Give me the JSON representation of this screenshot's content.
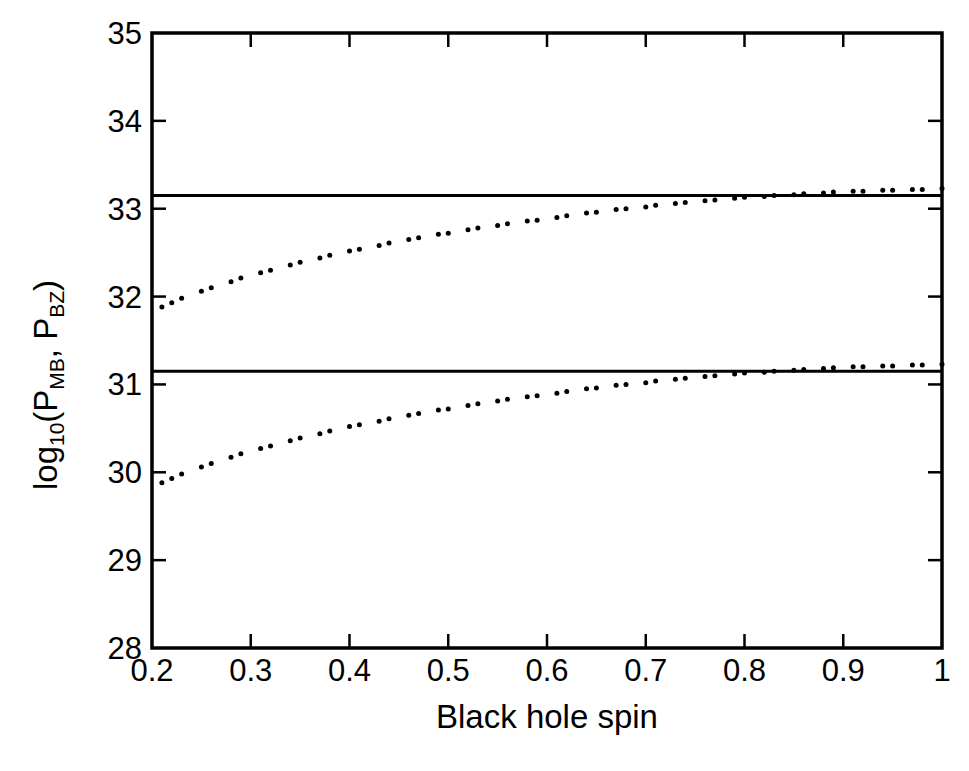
{
  "figure": {
    "background": "#ffffff",
    "ink": "#000000",
    "width": 969,
    "height": 771
  },
  "chart_data": {
    "type": "scatter",
    "title": "",
    "subtitle": "",
    "xlabel": "Black hole spin",
    "ylabel": "log10(PMB, PBZ)",
    "ylabel_parts": {
      "prefix": "log",
      "prefix_sub": "10",
      "open": "(P",
      "sub1": "MB",
      "mid": ", P",
      "sub2": "BZ",
      "close": ")"
    },
    "xlim": [
      0.2,
      1.0
    ],
    "ylim": [
      28,
      35
    ],
    "xticks": [
      0.2,
      0.3,
      0.4,
      0.5,
      0.6,
      0.7,
      0.8,
      0.9,
      1.0
    ],
    "xticklabels": [
      "0.2",
      "0.3",
      "0.4",
      "0.5",
      "0.6",
      "0.7",
      "0.8",
      "0.9",
      "1"
    ],
    "yticks": [
      28,
      29,
      30,
      31,
      32,
      33,
      34,
      35
    ],
    "yticklabels": [
      "28",
      "29",
      "30",
      "31",
      "32",
      "33",
      "34",
      "35"
    ],
    "grid": false,
    "legend": null,
    "frame": "box",
    "tick_direction": "in",
    "series": [
      {
        "name": "P_BZ",
        "style": "dotted",
        "marker": "dot",
        "marker_size_px": 5,
        "color": "#000000",
        "x": [
          0.21,
          0.22,
          0.23,
          0.25,
          0.26,
          0.28,
          0.29,
          0.31,
          0.32,
          0.34,
          0.35,
          0.37,
          0.38,
          0.4,
          0.41,
          0.43,
          0.44,
          0.46,
          0.47,
          0.49,
          0.5,
          0.52,
          0.53,
          0.55,
          0.56,
          0.58,
          0.59,
          0.61,
          0.62,
          0.64,
          0.65,
          0.67,
          0.68,
          0.7,
          0.71,
          0.73,
          0.74,
          0.76,
          0.77,
          0.79,
          0.8,
          0.82,
          0.83,
          0.85,
          0.86,
          0.88,
          0.89,
          0.91,
          0.92,
          0.94,
          0.95,
          0.97,
          0.98,
          1.0
        ],
        "y": [
          31.88,
          31.93,
          31.98,
          32.06,
          32.1,
          32.17,
          32.21,
          32.27,
          32.3,
          32.36,
          32.39,
          32.44,
          32.47,
          32.52,
          32.54,
          32.58,
          32.61,
          32.65,
          32.67,
          32.71,
          32.72,
          32.76,
          32.78,
          32.81,
          32.83,
          32.86,
          32.87,
          32.9,
          32.92,
          32.95,
          32.96,
          32.99,
          33.0,
          33.02,
          33.04,
          33.06,
          33.07,
          33.09,
          33.1,
          33.12,
          33.13,
          33.14,
          33.15,
          33.16,
          33.17,
          33.18,
          33.19,
          33.2,
          33.2,
          33.21,
          33.21,
          33.22,
          33.22,
          33.23
        ]
      },
      {
        "name": "P_MB",
        "style": "dotted",
        "marker": "dot",
        "marker_size_px": 5,
        "color": "#000000",
        "x": [
          0.21,
          0.22,
          0.23,
          0.25,
          0.26,
          0.28,
          0.29,
          0.31,
          0.32,
          0.34,
          0.35,
          0.37,
          0.38,
          0.4,
          0.41,
          0.43,
          0.44,
          0.46,
          0.47,
          0.49,
          0.5,
          0.52,
          0.53,
          0.55,
          0.56,
          0.58,
          0.59,
          0.61,
          0.62,
          0.64,
          0.65,
          0.67,
          0.68,
          0.7,
          0.71,
          0.73,
          0.74,
          0.76,
          0.77,
          0.79,
          0.8,
          0.82,
          0.83,
          0.85,
          0.86,
          0.88,
          0.89,
          0.91,
          0.92,
          0.94,
          0.95,
          0.97,
          0.98,
          1.0
        ],
        "y": [
          29.88,
          29.93,
          29.98,
          30.06,
          30.1,
          30.17,
          30.21,
          30.27,
          30.3,
          30.36,
          30.39,
          30.44,
          30.47,
          30.52,
          30.54,
          30.58,
          30.61,
          30.65,
          30.67,
          30.71,
          30.72,
          30.76,
          30.78,
          30.81,
          30.83,
          30.86,
          30.87,
          30.9,
          30.92,
          30.95,
          30.96,
          30.99,
          31.0,
          31.02,
          31.04,
          31.06,
          31.07,
          31.09,
          31.1,
          31.12,
          31.13,
          31.14,
          31.15,
          31.16,
          31.17,
          31.18,
          31.19,
          31.2,
          31.2,
          31.21,
          31.21,
          31.22,
          31.22,
          31.23
        ]
      }
    ],
    "hlines": [
      {
        "name": "upper-reference-line",
        "y": 33.15,
        "color": "#000000",
        "width_px": 3
      },
      {
        "name": "lower-reference-line",
        "y": 31.15,
        "color": "#000000",
        "width_px": 3
      }
    ],
    "annotations": []
  }
}
